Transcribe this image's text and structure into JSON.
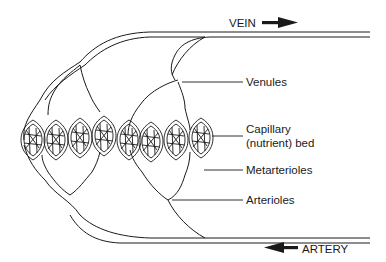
{
  "diagram": {
    "type": "capillary bed schematic",
    "colors": {
      "line": "#1a1a1a",
      "background": "#ffffff"
    },
    "flow_labels": {
      "vein": "VEIN",
      "artery": "ARTERY",
      "vein_arrow": "arrow-right",
      "artery_arrow": "arrow-left"
    },
    "labels": {
      "venules": "Venules",
      "capillary_line1": "Capillary",
      "capillary_line2": "(nutrient) bed",
      "metarterioles": "Metarterioles",
      "arterioles": "Arterioles"
    }
  }
}
